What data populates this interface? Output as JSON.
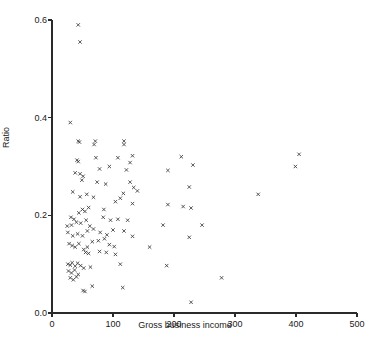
{
  "chart_data": {
    "type": "scatter",
    "title": "",
    "xlabel": "Gross business income",
    "ylabel": "Ratio",
    "xlim": [
      0,
      500
    ],
    "ylim": [
      0.0,
      0.6
    ],
    "xticks": [
      0,
      100,
      200,
      300,
      400,
      500
    ],
    "xtick_labels": [
      "0",
      "100",
      "200",
      "300",
      "400",
      "500"
    ],
    "yticks": [
      0.0,
      0.2,
      0.4,
      0.6
    ],
    "ytick_labels": [
      "0.0",
      "0.2",
      "0.4",
      "0.6"
    ],
    "grid": false,
    "legend": null,
    "marker": "x-cross",
    "marker_color": "#3a3a3a",
    "points": [
      [
        43,
        0.59
      ],
      [
        46,
        0.555
      ],
      [
        30,
        0.39
      ],
      [
        43,
        0.352
      ],
      [
        45,
        0.35
      ],
      [
        71,
        0.352
      ],
      [
        69,
        0.345
      ],
      [
        118,
        0.352
      ],
      [
        118,
        0.345
      ],
      [
        41,
        0.313
      ],
      [
        43,
        0.31
      ],
      [
        72,
        0.318
      ],
      [
        108,
        0.318
      ],
      [
        132,
        0.322
      ],
      [
        212,
        0.32
      ],
      [
        405,
        0.325
      ],
      [
        38,
        0.287
      ],
      [
        46,
        0.285
      ],
      [
        51,
        0.28
      ],
      [
        78,
        0.295
      ],
      [
        94,
        0.3
      ],
      [
        122,
        0.293
      ],
      [
        128,
        0.308
      ],
      [
        190,
        0.292
      ],
      [
        231,
        0.303
      ],
      [
        399,
        0.3
      ],
      [
        34,
        0.248
      ],
      [
        49,
        0.272
      ],
      [
        74,
        0.268
      ],
      [
        88,
        0.264
      ],
      [
        128,
        0.268
      ],
      [
        134,
        0.257
      ],
      [
        225,
        0.258
      ],
      [
        46,
        0.238
      ],
      [
        57,
        0.243
      ],
      [
        68,
        0.237
      ],
      [
        117,
        0.245
      ],
      [
        140,
        0.25
      ],
      [
        338,
        0.243
      ],
      [
        31,
        0.196
      ],
      [
        36,
        0.192
      ],
      [
        44,
        0.205
      ],
      [
        50,
        0.212
      ],
      [
        54,
        0.208
      ],
      [
        60,
        0.216
      ],
      [
        85,
        0.212
      ],
      [
        104,
        0.228
      ],
      [
        112,
        0.235
      ],
      [
        132,
        0.224
      ],
      [
        190,
        0.222
      ],
      [
        215,
        0.218
      ],
      [
        228,
        0.215
      ],
      [
        25,
        0.178
      ],
      [
        32,
        0.18
      ],
      [
        40,
        0.186
      ],
      [
        47,
        0.184
      ],
      [
        56,
        0.19
      ],
      [
        62,
        0.178
      ],
      [
        84,
        0.196
      ],
      [
        96,
        0.19
      ],
      [
        108,
        0.192
      ],
      [
        124,
        0.19
      ],
      [
        182,
        0.18
      ],
      [
        246,
        0.18
      ],
      [
        26,
        0.165
      ],
      [
        34,
        0.158
      ],
      [
        42,
        0.162
      ],
      [
        50,
        0.158
      ],
      [
        58,
        0.168
      ],
      [
        68,
        0.172
      ],
      [
        79,
        0.165
      ],
      [
        90,
        0.16
      ],
      [
        100,
        0.17
      ],
      [
        118,
        0.168
      ],
      [
        132,
        0.157
      ],
      [
        225,
        0.155
      ],
      [
        28,
        0.142
      ],
      [
        33,
        0.138
      ],
      [
        38,
        0.135
      ],
      [
        44,
        0.142
      ],
      [
        52,
        0.13
      ],
      [
        58,
        0.135
      ],
      [
        66,
        0.146
      ],
      [
        76,
        0.148
      ],
      [
        86,
        0.152
      ],
      [
        94,
        0.14
      ],
      [
        102,
        0.136
      ],
      [
        160,
        0.135
      ],
      [
        55,
        0.124
      ],
      [
        60,
        0.122
      ],
      [
        78,
        0.126
      ],
      [
        89,
        0.124
      ],
      [
        104,
        0.12
      ],
      [
        26,
        0.1
      ],
      [
        30,
        0.098
      ],
      [
        33,
        0.103
      ],
      [
        38,
        0.096
      ],
      [
        42,
        0.102
      ],
      [
        47,
        0.097
      ],
      [
        52,
        0.092
      ],
      [
        63,
        0.094
      ],
      [
        112,
        0.1
      ],
      [
        188,
        0.097
      ],
      [
        27,
        0.086
      ],
      [
        32,
        0.082
      ],
      [
        37,
        0.088
      ],
      [
        43,
        0.079
      ],
      [
        30,
        0.072
      ],
      [
        35,
        0.068
      ],
      [
        40,
        0.074
      ],
      [
        278,
        0.072
      ],
      [
        51,
        0.046
      ],
      [
        54,
        0.044
      ],
      [
        66,
        0.055
      ],
      [
        116,
        0.052
      ],
      [
        228,
        0.022
      ]
    ]
  }
}
